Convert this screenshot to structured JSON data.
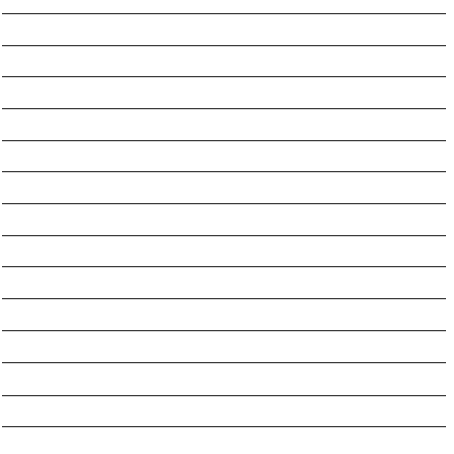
{
  "sheet": {
    "type": "lined-paper",
    "background_color": "#ffffff",
    "line_color": "#3a3a3a",
    "line_count": 14,
    "lines_y": [
      13,
      45,
      76,
      108,
      140,
      171,
      203,
      235,
      266,
      298,
      330,
      362,
      395,
      426
    ],
    "line_x_start": 2,
    "line_x_end": 446
  }
}
